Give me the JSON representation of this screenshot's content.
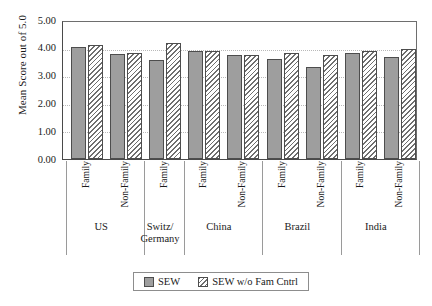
{
  "chart_data": {
    "type": "bar",
    "title": "",
    "xlabel": "",
    "ylabel": "Mean Score out of 5.0",
    "ylim": [
      0,
      5
    ],
    "ytick_labels": [
      "5.00",
      "4.00",
      "3.00",
      "2.00",
      "1.00",
      "0.00"
    ],
    "ytick_values": [
      5,
      4,
      3,
      2,
      1,
      0
    ],
    "grid": "horizontal-dotted",
    "legend_position": "bottom-center",
    "categories": [
      "US / Family",
      "US / Non-Family",
      "Switz/Germany / Family",
      "China / Family",
      "China / Non-Family",
      "Brazil / Family",
      "Brazil / Non-Family",
      "India / Family",
      "India / Non-Family"
    ],
    "groups": [
      {
        "name": "US",
        "name_lines": [
          "US"
        ],
        "subcategories": [
          {
            "label": "Family",
            "sew": 4.1,
            "sew_wo_fam_cntrl": 4.15
          },
          {
            "label": "Non-Family",
            "sew": 3.85,
            "sew_wo_fam_cntrl": 3.87
          }
        ]
      },
      {
        "name": "Switz/Germany",
        "name_lines": [
          "Switz/",
          "Germany"
        ],
        "subcategories": [
          {
            "label": "Family",
            "sew": 3.62,
            "sew_wo_fam_cntrl": 4.22
          }
        ]
      },
      {
        "name": "China",
        "name_lines": [
          "China"
        ],
        "subcategories": [
          {
            "label": "Family",
            "sew": 3.93,
            "sew_wo_fam_cntrl": 3.93
          },
          {
            "label": "Non-Family",
            "sew": 3.78,
            "sew_wo_fam_cntrl": 3.78
          }
        ]
      },
      {
        "name": "Brazil",
        "name_lines": [
          "Brazil"
        ],
        "subcategories": [
          {
            "label": "Family",
            "sew": 3.64,
            "sew_wo_fam_cntrl": 3.86
          },
          {
            "label": "Non-Family",
            "sew": 3.37,
            "sew_wo_fam_cntrl": 3.8
          }
        ]
      },
      {
        "name": "India",
        "name_lines": [
          "India"
        ],
        "subcategories": [
          {
            "label": "Family",
            "sew": 3.88,
            "sew_wo_fam_cntrl": 3.95
          },
          {
            "label": "Non-Family",
            "sew": 3.74,
            "sew_wo_fam_cntrl": 4.03
          }
        ]
      }
    ],
    "series": [
      {
        "name": "SEW",
        "style": "solid-gray",
        "color": "#9e9e9e",
        "values": [
          4.1,
          3.85,
          3.62,
          3.93,
          3.78,
          3.64,
          3.37,
          3.88,
          3.74
        ]
      },
      {
        "name": "SEW w/o Fam Cntrl",
        "style": "diagonal-hatch",
        "color": "#6f6f6f",
        "values": [
          4.15,
          3.87,
          4.22,
          3.93,
          3.78,
          3.86,
          3.8,
          3.95,
          4.03
        ]
      }
    ]
  },
  "legend": {
    "items": [
      {
        "label": "SEW",
        "swatch": "solid-swatch-icon"
      },
      {
        "label": "SEW w/o Fam Cntrl",
        "swatch": "hatched-swatch-icon"
      }
    ]
  }
}
